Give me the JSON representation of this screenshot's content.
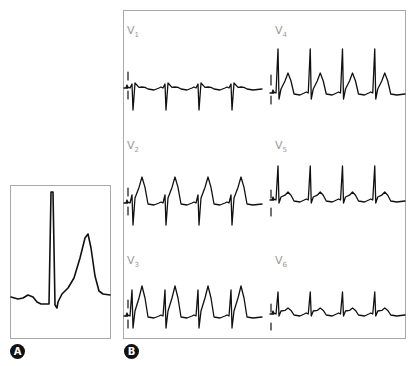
{
  "figure": {
    "panels": [
      {
        "id": "A",
        "badge": "A",
        "description": "single enlarged beat: P wave, narrow tall QRS, tall peaked T wave"
      },
      {
        "id": "B",
        "badge": "B",
        "description": "precordial leads V1–V6"
      }
    ],
    "leads": [
      {
        "key": "V1",
        "prefix": "V",
        "sub": "1",
        "morphology": "rS, deep S waves, small R"
      },
      {
        "key": "V2",
        "prefix": "V",
        "sub": "2",
        "morphology": "tall peaked T waves"
      },
      {
        "key": "V3",
        "prefix": "V",
        "sub": "3",
        "morphology": "tall peaked T waves"
      },
      {
        "key": "V4",
        "prefix": "V",
        "sub": "4",
        "morphology": "tall R, peaked T"
      },
      {
        "key": "V5",
        "prefix": "V",
        "sub": "5",
        "morphology": "tall R, small T"
      },
      {
        "key": "V6",
        "prefix": "V",
        "sub": "6",
        "morphology": "R waves, small T"
      }
    ],
    "beats_per_strip": 4,
    "colors": {
      "trace": "#111111",
      "frame": "#a9a9a9",
      "label": "#9a9a9a",
      "badge_bg": "#111111",
      "badge_fg": "#ffffff"
    }
  }
}
